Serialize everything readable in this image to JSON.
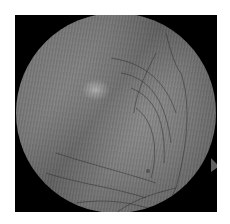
{
  "image": {
    "type": "fundus-photograph",
    "palette": {
      "background": "#ffffff",
      "frame": "#000000",
      "retina_mid": "#7a7a7a",
      "lesion_highlight": "#c9c9c9",
      "vessel": "#2a2a2a"
    }
  }
}
